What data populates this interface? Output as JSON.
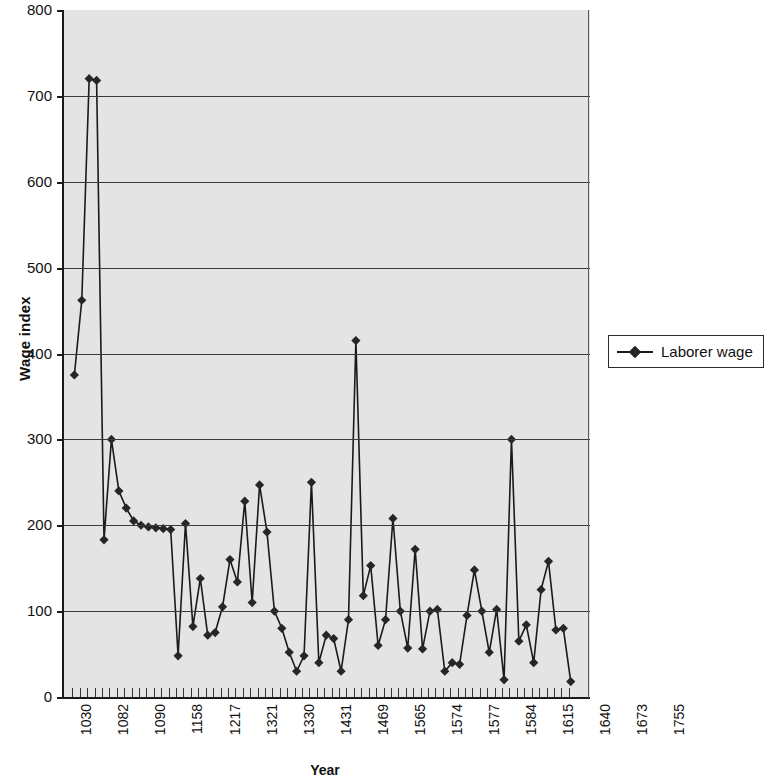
{
  "chart_data": {
    "type": "line",
    "title": "",
    "xlabel": "Year",
    "ylabel": "Wage index",
    "ylim": [
      0,
      800
    ],
    "yticks": [
      0,
      100,
      200,
      300,
      400,
      500,
      600,
      700,
      800
    ],
    "grid": true,
    "legend_position": "right",
    "legend": [
      "Laborer wage"
    ],
    "marker": "diamond",
    "x_tick_labels": [
      "1030",
      "1082",
      "1090",
      "1158",
      "1217",
      "1321",
      "1330",
      "1431",
      "1469",
      "1565",
      "1574",
      "1577",
      "1584",
      "1615",
      "1640",
      "1673",
      "1755"
    ],
    "x_tick_label_indices": [
      0,
      5,
      10,
      15,
      20,
      25,
      30,
      35,
      40,
      45,
      50,
      55,
      60,
      65,
      70,
      75,
      80
    ],
    "series": [
      {
        "name": "Laborer wage",
        "values": [
          375,
          462,
          720,
          718,
          183,
          300,
          240,
          220,
          205,
          200,
          198,
          197,
          196,
          195,
          48,
          202,
          82,
          138,
          72,
          75,
          105,
          160,
          134,
          228,
          110,
          247,
          192,
          100,
          80,
          52,
          30,
          48,
          250,
          40,
          72,
          68,
          30,
          90,
          415,
          118,
          153,
          60,
          90,
          208,
          100,
          57,
          172,
          56,
          100,
          102,
          30,
          40,
          38,
          95,
          148,
          100,
          52,
          102,
          20,
          300,
          65,
          84,
          40,
          125,
          158,
          78,
          80,
          18
        ]
      }
    ]
  },
  "axes": {
    "y_title": "Wage index",
    "x_title": "Year"
  },
  "legend": {
    "items": [
      {
        "label": "Laborer wage",
        "color": "#262626",
        "marker": "diamond"
      }
    ]
  }
}
